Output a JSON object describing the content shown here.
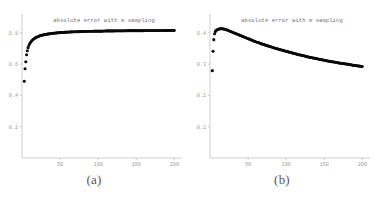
{
  "figure": {
    "panels": [
      {
        "caption": "(a)",
        "title": "absolute error with m sampling"
      },
      {
        "caption": "(b)",
        "title": "absolute error with m sampling"
      }
    ]
  },
  "chart_data": [
    {
      "type": "scatter",
      "panel": "(a)",
      "title": "absolute error with m sampling",
      "xlabel": "",
      "ylabel": "",
      "xlim": [
        0,
        210
      ],
      "ylim": [
        0,
        0.92
      ],
      "grid": false,
      "legend": null,
      "xticks": [
        50,
        100,
        150,
        200
      ],
      "xtick_labels": [
        "50",
        "100",
        "150",
        "200"
      ],
      "yticks": [
        0.2,
        0.4,
        0.6,
        0.8
      ],
      "ytick_labels": [
        "0.2",
        "0.4",
        "0.6",
        "0.8"
      ],
      "x": [
        3,
        4,
        5,
        6,
        7,
        8,
        9,
        10,
        11,
        12,
        13,
        14,
        15,
        16,
        17,
        18,
        19,
        20,
        22,
        24,
        26,
        28,
        30,
        32,
        34,
        36,
        38,
        40,
        44,
        48,
        52,
        56,
        60,
        64,
        68,
        72,
        76,
        80,
        86,
        92,
        98,
        104,
        110,
        116,
        122,
        128,
        134,
        140,
        146,
        152,
        158,
        164,
        170,
        176,
        182,
        188,
        194,
        200
      ],
      "y": [
        0.49,
        0.57,
        0.615,
        0.66,
        0.685,
        0.705,
        0.718,
        0.728,
        0.736,
        0.743,
        0.749,
        0.754,
        0.758,
        0.762,
        0.765,
        0.768,
        0.771,
        0.773,
        0.777,
        0.781,
        0.784,
        0.786,
        0.788,
        0.79,
        0.792,
        0.793,
        0.795,
        0.796,
        0.798,
        0.8,
        0.801,
        0.803,
        0.804,
        0.805,
        0.806,
        0.806,
        0.807,
        0.808,
        0.809,
        0.809,
        0.81,
        0.81,
        0.811,
        0.811,
        0.812,
        0.812,
        0.812,
        0.813,
        0.813,
        0.813,
        0.813,
        0.814,
        0.814,
        0.814,
        0.814,
        0.814,
        0.815,
        0.815
      ]
    },
    {
      "type": "scatter",
      "panel": "(b)",
      "title": "absolute error with m sampling",
      "xlabel": "",
      "ylabel": "",
      "xlim": [
        0,
        210
      ],
      "ylim": [
        0,
        0.46
      ],
      "grid": false,
      "legend": null,
      "xticks": [
        50,
        100,
        150,
        200
      ],
      "xtick_labels": [
        "50",
        "100",
        "150",
        "200"
      ],
      "yticks": [
        0.1,
        0.2,
        0.3,
        0.4
      ],
      "ytick_labels": [
        "0.1",
        "0.2",
        "0.3",
        "0.4"
      ],
      "x": [
        3,
        4,
        5,
        6,
        7,
        8,
        9,
        10,
        11,
        12,
        13,
        14,
        15,
        16,
        17,
        18,
        19,
        20,
        22,
        24,
        26,
        28,
        30,
        32,
        34,
        36,
        38,
        40,
        44,
        48,
        52,
        56,
        60,
        64,
        68,
        72,
        76,
        80,
        86,
        92,
        98,
        104,
        110,
        116,
        122,
        128,
        134,
        140,
        146,
        152,
        158,
        164,
        170,
        176,
        182,
        188,
        194,
        200
      ],
      "y": [
        0.279,
        0.341,
        0.378,
        0.397,
        0.404,
        0.407,
        0.409,
        0.41,
        0.411,
        0.412,
        0.412,
        0.413,
        0.413,
        0.413,
        0.412,
        0.412,
        0.411,
        0.411,
        0.409,
        0.407,
        0.405,
        0.403,
        0.401,
        0.399,
        0.397,
        0.395,
        0.393,
        0.391,
        0.387,
        0.383,
        0.379,
        0.375,
        0.371,
        0.368,
        0.364,
        0.361,
        0.358,
        0.355,
        0.35,
        0.346,
        0.342,
        0.338,
        0.334,
        0.33,
        0.327,
        0.323,
        0.32,
        0.317,
        0.314,
        0.311,
        0.308,
        0.306,
        0.303,
        0.301,
        0.299,
        0.296,
        0.294,
        0.292
      ]
    }
  ]
}
